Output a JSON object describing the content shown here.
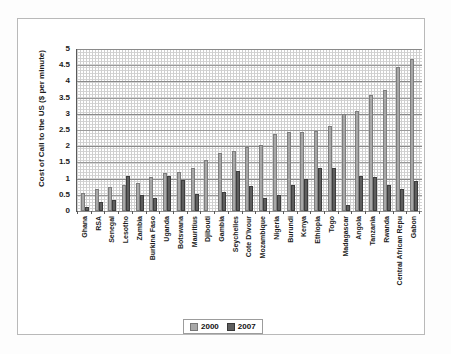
{
  "chart_data": {
    "type": "bar",
    "title": "",
    "xlabel": "",
    "ylabel": "Cost of Call to the US ($ per minute)",
    "ylim": [
      0,
      5
    ],
    "ytick_labels": [
      "5",
      "4.5",
      "4",
      "3.5",
      "3",
      "2.5",
      "2",
      "1.5",
      "1",
      "0.5",
      "0"
    ],
    "grid": true,
    "legend_position": "bottom",
    "categories": [
      "Ghana",
      "RSA",
      "Senegal",
      "Lesotho",
      "Zambia",
      "Burkina Faso",
      "Uganda",
      "Botswana",
      "Mauritius",
      "Djibouti",
      "Gambia",
      "Seychelles",
      "Cote D'Ivour",
      "Mozambique",
      "Nigeria",
      "Burundi",
      "Kenya",
      "Ethiopia",
      "Togo",
      "Madagascar",
      "Angola",
      "Tanzania",
      "Rwanda",
      "Central African Repu",
      "Gabon"
    ],
    "series": [
      {
        "name": "2000",
        "color": "#a8a8a8",
        "values": [
          0.55,
          0.68,
          0.73,
          0.79,
          0.85,
          1.06,
          1.18,
          1.19,
          1.33,
          1.57,
          1.79,
          1.85,
          1.99,
          2.04,
          2.37,
          2.45,
          2.45,
          2.46,
          2.63,
          3.0,
          3.09,
          3.57,
          3.75,
          4.43,
          4.68
        ]
      },
      {
        "name": "2007",
        "color": "#5e5e5e",
        "values": [
          0.13,
          0.27,
          0.34,
          1.09,
          0.5,
          0.41,
          1.07,
          0.97,
          0.54,
          0.0,
          0.6,
          1.23,
          0.77,
          0.4,
          0.5,
          0.8,
          0.98,
          1.33,
          1.32,
          0.19,
          1.07,
          1.05,
          0.79,
          0.68,
          0.92
        ]
      }
    ]
  },
  "legend": {
    "items": [
      {
        "label": "2000",
        "swatch": "legend-swatch-2000"
      },
      {
        "label": "2007",
        "swatch": "legend-swatch-2007"
      }
    ]
  },
  "colors": {
    "series_2000": "#a8a8a8",
    "series_2007": "#5e5e5e",
    "axis": "#5a5a5a",
    "grid": "#cfcfcf",
    "frame": "#b9b9b9",
    "text": "#1b1b1b"
  }
}
